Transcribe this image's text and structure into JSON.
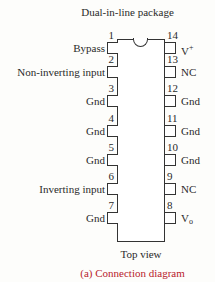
{
  "title": "Dual-in-line package",
  "view_label": "Top view",
  "caption": "(a) Connection diagram",
  "colors": {
    "outline": "#333333",
    "text": "#2a2a2a",
    "caption": "#b8212c"
  },
  "left_pins": [
    {
      "num": "1",
      "label": "Bypass",
      "y": 42
    },
    {
      "num": "2",
      "label": "Non-inverting input",
      "y": 66
    },
    {
      "num": "3",
      "label": "Gnd",
      "y": 95
    },
    {
      "num": "4",
      "label": "Gnd",
      "y": 125
    },
    {
      "num": "5",
      "label": "Gnd",
      "y": 154
    },
    {
      "num": "6",
      "label": "Inverting input",
      "y": 183
    },
    {
      "num": "7",
      "label": "Gnd",
      "y": 212
    }
  ],
  "right_pins": [
    {
      "num": "14",
      "label": "V+",
      "y": 42
    },
    {
      "num": "13",
      "label": "NC",
      "y": 66
    },
    {
      "num": "12",
      "label": "Gnd",
      "y": 95
    },
    {
      "num": "11",
      "label": "Gnd",
      "y": 125
    },
    {
      "num": "10",
      "label": "Gnd",
      "y": 154
    },
    {
      "num": "9",
      "label": "NC",
      "y": 183
    },
    {
      "num": "8",
      "label": "Vo",
      "y": 212
    }
  ]
}
